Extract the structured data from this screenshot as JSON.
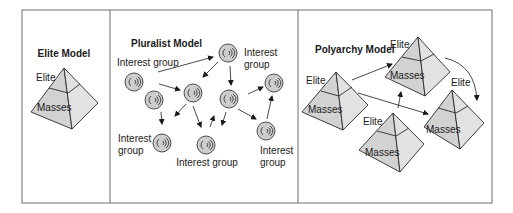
{
  "panels": [
    {
      "id": "elite",
      "title": "Elite Model",
      "pyramid": {
        "top_label": "Elite",
        "bottom_label": "Masses"
      }
    },
    {
      "id": "pluralist",
      "title": "Pluralist Model",
      "group_label": "Interest group",
      "group_label_line1": "Interest",
      "group_label_line2": "group",
      "circle_count": 9
    },
    {
      "id": "polyarchy",
      "title": "Polyarchy Model",
      "pyramids": [
        {
          "top_label": "Elite",
          "bottom_label": "Masses"
        },
        {
          "top_label": "Elite",
          "bottom_label": "Masses"
        },
        {
          "top_label": "Elite",
          "bottom_label": "Masses"
        },
        {
          "top_label": "Elite",
          "bottom_label": "Masses"
        }
      ]
    }
  ],
  "colors": {
    "frame": "#6e6e6e",
    "face_left": "#d2d2d2",
    "face_right": "#e2e2e2",
    "circle_fill": "#cdcdcd",
    "stroke": "#2a2a2a"
  }
}
